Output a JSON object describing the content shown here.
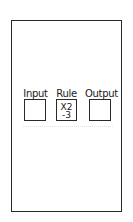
{
  "diagram": {
    "type": "function-machine",
    "frame": {
      "border_color": "#2a2a2a",
      "background": "#ffffff"
    },
    "columns": [
      {
        "label": "Input",
        "content": []
      },
      {
        "label": "Rule",
        "content": [
          "X2",
          "-3"
        ]
      },
      {
        "label": "Output",
        "content": []
      }
    ]
  }
}
